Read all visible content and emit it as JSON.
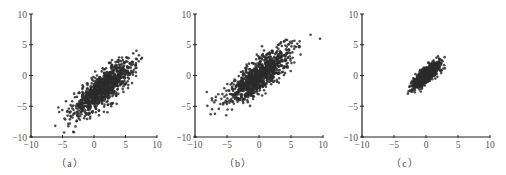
{
  "figure": {
    "background": "#ffffff",
    "axis_color": "#222222",
    "point_color": "#2b2b2b"
  },
  "chart_data": [
    {
      "type": "scatter",
      "title": "",
      "caption": "（a）",
      "xlabel": "",
      "ylabel": "",
      "xlim": [
        -10,
        10
      ],
      "ylim": [
        -10,
        10
      ],
      "xticks": [
        -10,
        -5,
        0,
        5,
        10
      ],
      "yticks": [
        -10,
        -5,
        0,
        5
      ],
      "ytick_top": 10,
      "grid": false,
      "n_points": 1000,
      "mean": [
        1.5,
        -2.0
      ],
      "std": [
        2.4,
        2.2
      ],
      "correlation": 0.8,
      "description": "Correlated 2D Gaussian cloud, original data"
    },
    {
      "type": "scatter",
      "title": "",
      "caption": "（b）",
      "xlabel": "",
      "ylabel": "",
      "xlim": [
        -10,
        10
      ],
      "ylim": [
        -10,
        10
      ],
      "xticks": [
        -10,
        -5,
        0,
        5,
        10
      ],
      "yticks": [
        -10,
        -5,
        0,
        5
      ],
      "ytick_top": 10,
      "grid": false,
      "n_points": 1000,
      "mean": [
        0.0,
        0.0
      ],
      "std": [
        2.4,
        2.2
      ],
      "correlation": 0.8,
      "description": "Zero-centered data (mean subtracted)"
    },
    {
      "type": "scatter",
      "title": "",
      "caption": "（c）",
      "xlabel": "",
      "ylabel": "",
      "xlim": [
        -10,
        10
      ],
      "ylim": [
        -10,
        10
      ],
      "xticks": [
        -10,
        -5,
        0,
        5,
        10
      ],
      "yticks": [
        -10,
        -5,
        0,
        5
      ],
      "ytick_top": 10,
      "grid": false,
      "n_points": 1000,
      "mean": [
        0.0,
        0.0
      ],
      "std": [
        1.0,
        1.0
      ],
      "correlation": 0.8,
      "description": "Normalized data (zero mean, unit variance)"
    }
  ],
  "panels": [
    {
      "left": 0,
      "axis_x0": 31,
      "axis_x1": 157,
      "axis_y_top": 14,
      "axis_y_bottom": 137,
      "caption": "（a）",
      "caption_x": 70
    },
    {
      "left": 168,
      "axis_x0": 27,
      "axis_x1": 155,
      "axis_y_top": 14,
      "axis_y_bottom": 137,
      "caption": "（b）",
      "caption_x": 70
    },
    {
      "left": 336,
      "axis_x0": 26,
      "axis_x1": 154,
      "axis_y_top": 14,
      "axis_y_bottom": 137,
      "caption": "（c）",
      "caption_x": 69
    }
  ]
}
